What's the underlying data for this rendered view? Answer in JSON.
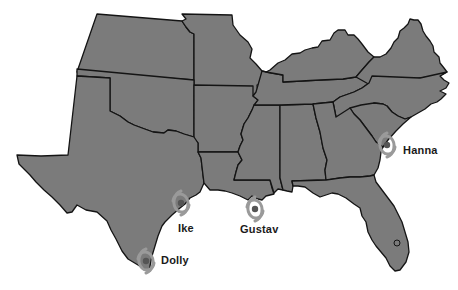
{
  "map": {
    "title": "Southern United States hurricane landfalls",
    "fill_color": "#7b7b7b",
    "border_color": "#141414",
    "background": "#ffffff",
    "states": [
      "Kansas",
      "Missouri",
      "Oklahoma",
      "Arkansas",
      "Texas",
      "Louisiana",
      "Mississippi",
      "Alabama",
      "Tennessee",
      "Kentucky",
      "Georgia",
      "Florida",
      "South Carolina",
      "North Carolina",
      "Virginia"
    ]
  },
  "hurricanes": [
    {
      "name": "Dolly",
      "icon": "hurricane-icon",
      "x": 146,
      "y": 260,
      "label_x": 161,
      "label_y": 259
    },
    {
      "name": "Ike",
      "icon": "hurricane-icon",
      "x": 182,
      "y": 203,
      "label_x": 178,
      "label_y": 225
    },
    {
      "name": "Gustav",
      "icon": "hurricane-icon",
      "x": 255,
      "y": 209,
      "label_x": 240,
      "label_y": 226
    },
    {
      "name": "Hanna",
      "icon": "hurricane-icon",
      "x": 387,
      "y": 144,
      "label_x": 403,
      "label_y": 148
    }
  ]
}
